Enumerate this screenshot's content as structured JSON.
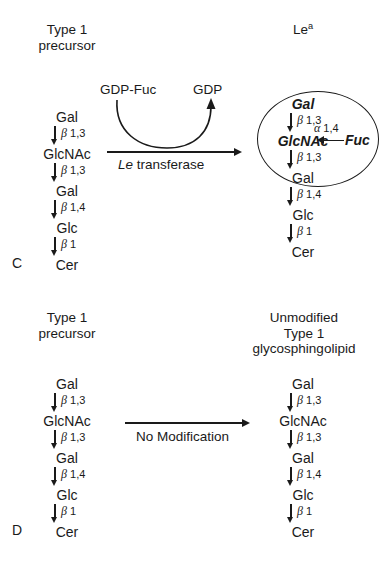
{
  "figure": {
    "panels": [
      {
        "letter": "C",
        "left_header": [
          "Type 1",
          "precursor"
        ],
        "right_header_main": "Le",
        "right_header_sup": "a",
        "reaction_label_italic": "Le",
        "reaction_label_rest": " transferase",
        "cofactor_in": "GDP-Fuc",
        "cofactor_out": "GDP",
        "left_chain": {
          "residues": [
            "Gal",
            "GlcNAc",
            "Gal",
            "Glc",
            "Cer"
          ],
          "bonds": [
            "β 1,3",
            "β 1,3",
            "β 1,4",
            "β 1"
          ]
        },
        "right_chain": {
          "residues": [
            "Gal",
            "GlcNAc",
            "Gal",
            "Glc",
            "Cer"
          ],
          "bonds": [
            "β 1,3",
            "β 1,3",
            "β 1,4",
            "β 1"
          ]
        },
        "branch": {
          "residue": "Fuc",
          "bond": "α 1,4"
        }
      },
      {
        "letter": "D",
        "left_header": [
          "Type 1",
          "precursor"
        ],
        "right_header": [
          "Unmodified",
          "Type 1",
          "glycosphingolipid"
        ],
        "reaction_label": "No Modification",
        "left_chain": {
          "residues": [
            "Gal",
            "GlcNAc",
            "Gal",
            "Glc",
            "Cer"
          ],
          "bonds": [
            "β 1,3",
            "β 1,3",
            "β 1,4",
            "β 1"
          ]
        },
        "right_chain": {
          "residues": [
            "Gal",
            "GlcNAc",
            "Gal",
            "Glc",
            "Cer"
          ],
          "bonds": [
            "β 1,3",
            "β 1,3",
            "β 1,4",
            "β 1"
          ]
        }
      }
    ]
  }
}
